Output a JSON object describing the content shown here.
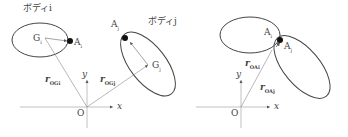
{
  "left": {
    "body_i_label": "ボディi",
    "body_j_label": "ボディj",
    "Gi": "G",
    "Gi_sub": "i",
    "Ai": "A",
    "Ai_sub": "i",
    "Gj": "G",
    "Gj_sub": "j",
    "Aj": "A",
    "Aj_sub": "j",
    "r_OGi": "r",
    "r_OGi_sub": "OGi",
    "r_OGj": "r",
    "r_OGj_sub": "OGj",
    "origin": "O",
    "x": "x",
    "y": "y"
  },
  "right": {
    "Ai": "A",
    "Ai_sub": "i",
    "Aj": "A",
    "Aj_sub": "j",
    "r_OAi": "r",
    "r_OAi_sub": "OAi",
    "r_OAj": "r",
    "r_OAj_sub": "OAj",
    "origin": "O",
    "x": "x",
    "y": "y"
  }
}
